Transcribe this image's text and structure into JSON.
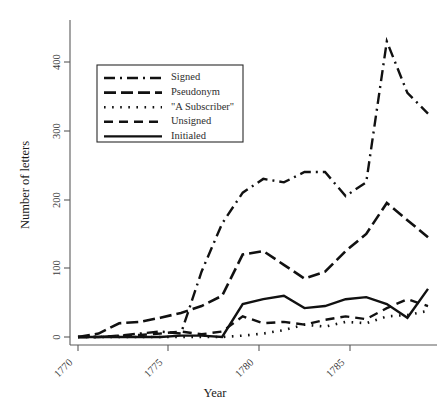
{
  "chart_data": {
    "type": "line",
    "title": "",
    "xlabel": "Year",
    "ylabel": "Number of letters",
    "xlim": [
      1770,
      1787
    ],
    "ylim": [
      -15,
      440
    ],
    "grid": false,
    "legend_position": "upper-left-inside",
    "xticks": [
      1770,
      1775,
      1780,
      1785
    ],
    "xtick_labels": [
      "1770",
      "1775",
      "1780",
      "1785"
    ],
    "yticks": [
      0,
      100,
      200,
      300,
      400
    ],
    "ytick_labels": [
      "0",
      "100",
      "200",
      "300",
      "400"
    ],
    "x": [
      1770,
      1771,
      1772,
      1773,
      1774,
      1775,
      1776,
      1777,
      1778,
      1779,
      1780,
      1781,
      1782,
      1783,
      1784,
      1785,
      1786,
      1787
    ],
    "series": [
      {
        "name": "Signed",
        "dash_style": "dash-dot",
        "values": [
          0,
          0,
          2,
          5,
          8,
          5,
          95,
          165,
          210,
          230,
          225,
          240,
          240,
          205,
          225,
          430,
          355,
          325
        ]
      },
      {
        "name": "Pseudonym",
        "dash_style": "long-dash",
        "values": [
          0,
          5,
          20,
          22,
          28,
          35,
          45,
          60,
          120,
          125,
          105,
          85,
          95,
          125,
          150,
          195,
          170,
          145
        ]
      },
      {
        "name": "\"A Subscriber\"",
        "dash_style": "dotted",
        "values": [
          0,
          0,
          0,
          0,
          0,
          0,
          0,
          0,
          2,
          5,
          10,
          18,
          15,
          22,
          20,
          30,
          32,
          38
        ]
      },
      {
        "name": "Unsigned",
        "dash_style": "dash",
        "values": [
          0,
          0,
          2,
          3,
          5,
          8,
          4,
          8,
          30,
          20,
          22,
          18,
          25,
          30,
          26,
          42,
          55,
          45
        ]
      },
      {
        "name": "Initialed",
        "dash_style": "solid",
        "values": [
          0,
          0,
          0,
          0,
          0,
          2,
          2,
          0,
          48,
          55,
          60,
          42,
          45,
          55,
          58,
          48,
          28,
          70
        ]
      }
    ]
  },
  "chart_extra": {
    "signed_tail": [
      360,
      355,
      325,
      322
    ],
    "pseudonym_tail": [
      170,
      168,
      150,
      145
    ],
    "initialed_tail": [
      78,
      85,
      80,
      78
    ],
    "unsigned_tail": [
      50,
      60,
      55,
      60
    ],
    "subscriber_tail": [
      35,
      40,
      38,
      28
    ]
  }
}
